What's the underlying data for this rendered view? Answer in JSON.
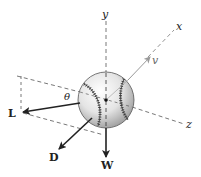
{
  "diagram": {
    "axes": {
      "x": {
        "label": "x"
      },
      "y": {
        "label": "y"
      },
      "z": {
        "label": "z"
      }
    },
    "velocity": {
      "label": "v",
      "color": "#999999"
    },
    "angle": {
      "label": "θ"
    },
    "forces": [
      {
        "id": "lift",
        "label": "L"
      },
      {
        "id": "drag",
        "label": "D"
      },
      {
        "id": "weight",
        "label": "W"
      }
    ],
    "colors": {
      "force_arrow": "#222222",
      "axis_dash": "#555555",
      "ball_fill": "#e8e8e8",
      "ball_stroke": "#444444",
      "seam": "#333333"
    }
  }
}
